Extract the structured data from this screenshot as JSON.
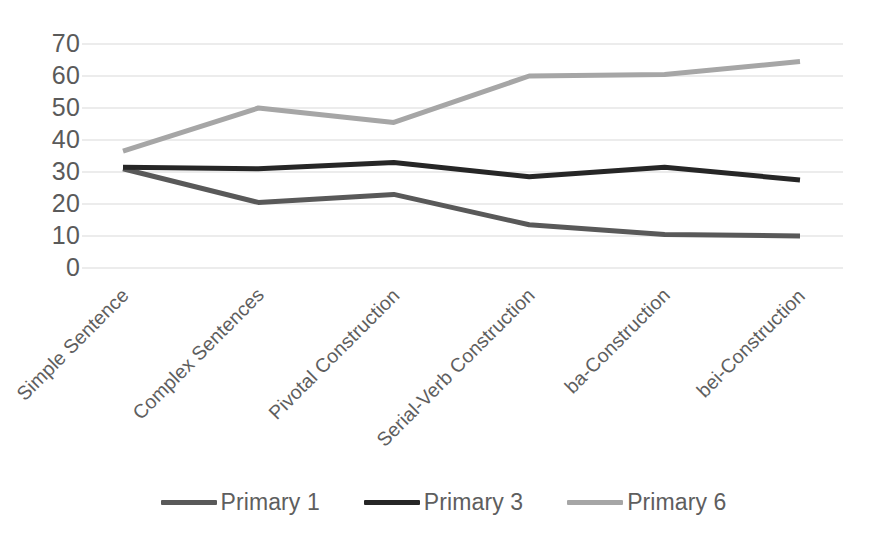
{
  "chart_data": {
    "type": "line",
    "title": "",
    "xlabel": "",
    "ylabel": "",
    "ylim": [
      0,
      70
    ],
    "ytick_step": 10,
    "yticks": [
      70,
      60,
      50,
      40,
      30,
      20,
      10,
      0
    ],
    "grid": true,
    "legend_position": "bottom",
    "categories": [
      "Simple Sentence",
      "Complex Sentences",
      "Pivotal Construction",
      "Serial-Verb Construction",
      "ba-Construction",
      "bei-Construction"
    ],
    "series": [
      {
        "name": "Primary 1",
        "color": "#595959",
        "values": [
          31,
          20.5,
          23,
          13.5,
          10.5,
          10
        ]
      },
      {
        "name": "Primary 3",
        "color": "#262626",
        "values": [
          31.5,
          31,
          33,
          28.5,
          31.5,
          27.5
        ]
      },
      {
        "name": "Primary 6",
        "color": "#a6a6a6",
        "values": [
          36.5,
          50,
          45.5,
          60,
          60.5,
          64.5
        ]
      }
    ]
  },
  "axis": {
    "y_tick_labels": [
      "70",
      "60",
      "50",
      "40",
      "30",
      "20",
      "10",
      "0"
    ],
    "x_tick_labels": [
      "Simple Sentence",
      "Complex Sentences",
      "Pivotal Construction",
      "Serial-Verb Construction",
      "ba-Construction",
      "bei-Construction"
    ]
  },
  "legend": {
    "items": [
      {
        "label": "Primary 1",
        "color": "#595959"
      },
      {
        "label": "Primary 3",
        "color": "#262626"
      },
      {
        "label": "Primary 6",
        "color": "#a6a6a6"
      }
    ]
  },
  "style": {
    "gridline_color": "#d9d9d9",
    "text_color": "#595959",
    "background": "#ffffff"
  }
}
